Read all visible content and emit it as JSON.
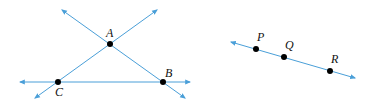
{
  "colors": {
    "line": "#4a9fd8",
    "point": "#000000",
    "label": "#111111"
  },
  "figure_left": {
    "points": [
      {
        "id": "A",
        "label": "A",
        "x": 110,
        "y": 44,
        "lx": 106,
        "ly": 37
      },
      {
        "id": "B",
        "label": "B",
        "x": 163,
        "y": 82,
        "lx": 165,
        "ly": 77
      },
      {
        "id": "C",
        "label": "C",
        "x": 58,
        "y": 82,
        "lx": 55,
        "ly": 96
      }
    ],
    "lines": [
      {
        "name": "line-CB",
        "x1": 20,
        "y1": 82,
        "x2": 190,
        "y2": 82
      },
      {
        "name": "line-CA",
        "x1": 35,
        "y1": 98,
        "x2": 157,
        "y2": 10
      },
      {
        "name": "line-AB",
        "x1": 62,
        "y1": 10,
        "x2": 185,
        "y2": 98
      }
    ]
  },
  "figure_right": {
    "points": [
      {
        "id": "P",
        "label": "P",
        "x": 256,
        "y": 49,
        "lx": 257,
        "ly": 41
      },
      {
        "id": "Q",
        "label": "Q",
        "x": 284,
        "y": 57,
        "lx": 285,
        "ly": 49
      },
      {
        "id": "R",
        "label": "R",
        "x": 330,
        "y": 71,
        "lx": 331,
        "ly": 63
      }
    ],
    "lines": [
      {
        "name": "line-PQR",
        "x1": 231,
        "y1": 42,
        "x2": 355,
        "y2": 78
      }
    ]
  }
}
